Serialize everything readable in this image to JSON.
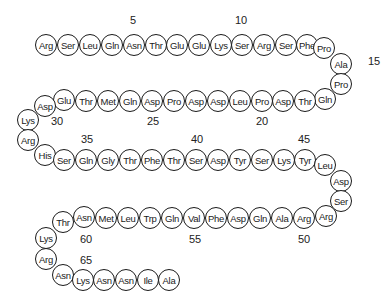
{
  "diagram": {
    "type": "peptide-sequence",
    "residues": [
      {
        "n": 1,
        "aa": "Arg",
        "x": 46,
        "y": 45
      },
      {
        "n": 2,
        "aa": "Ser",
        "x": 68,
        "y": 45
      },
      {
        "n": 3,
        "aa": "Leu",
        "x": 90,
        "y": 45
      },
      {
        "n": 4,
        "aa": "Gln",
        "x": 112,
        "y": 45
      },
      {
        "n": 5,
        "aa": "Asn",
        "x": 134,
        "y": 45
      },
      {
        "n": 6,
        "aa": "Thr",
        "x": 156,
        "y": 45
      },
      {
        "n": 7,
        "aa": "Glu",
        "x": 177,
        "y": 45
      },
      {
        "n": 8,
        "aa": "Glu",
        "x": 199,
        "y": 45
      },
      {
        "n": 9,
        "aa": "Lys",
        "x": 221,
        "y": 45
      },
      {
        "n": 10,
        "aa": "Ser",
        "x": 242,
        "y": 45
      },
      {
        "n": 11,
        "aa": "Arg",
        "x": 264,
        "y": 45
      },
      {
        "n": 12,
        "aa": "Ser",
        "x": 286,
        "y": 45
      },
      {
        "n": 13,
        "aa": "Phe",
        "x": 307,
        "y": 45
      },
      {
        "n": 14,
        "aa": "Pro",
        "x": 324,
        "y": 48
      },
      {
        "n": 15,
        "aa": "Ala",
        "x": 341,
        "y": 64
      },
      {
        "n": 16,
        "aa": "Pro",
        "x": 341,
        "y": 84
      },
      {
        "n": 17,
        "aa": "Gln",
        "x": 325,
        "y": 99
      },
      {
        "n": 18,
        "aa": "Thr",
        "x": 305,
        "y": 101
      },
      {
        "n": 19,
        "aa": "Asp",
        "x": 283,
        "y": 101
      },
      {
        "n": 20,
        "aa": "Pro",
        "x": 262,
        "y": 101
      },
      {
        "n": 21,
        "aa": "Leu",
        "x": 240,
        "y": 101
      },
      {
        "n": 22,
        "aa": "Asp",
        "x": 218,
        "y": 101
      },
      {
        "n": 23,
        "aa": "Asp",
        "x": 196,
        "y": 101
      },
      {
        "n": 24,
        "aa": "Pro",
        "x": 174,
        "y": 101
      },
      {
        "n": 25,
        "aa": "Asp",
        "x": 152,
        "y": 101
      },
      {
        "n": 26,
        "aa": "Gln",
        "x": 130,
        "y": 101
      },
      {
        "n": 27,
        "aa": "Met",
        "x": 108,
        "y": 101
      },
      {
        "n": 28,
        "aa": "Thr",
        "x": 86,
        "y": 101
      },
      {
        "n": 29,
        "aa": "Glu",
        "x": 64,
        "y": 100
      },
      {
        "n": 30,
        "aa": "Asp",
        "x": 45,
        "y": 106
      },
      {
        "n": 31,
        "aa": "Lys",
        "x": 28,
        "y": 120
      },
      {
        "n": 32,
        "aa": "Arg",
        "x": 28,
        "y": 140
      },
      {
        "n": 33,
        "aa": "His",
        "x": 45,
        "y": 155
      },
      {
        "n": 34,
        "aa": "Ser",
        "x": 64,
        "y": 160
      },
      {
        "n": 35,
        "aa": "Gln",
        "x": 86,
        "y": 160
      },
      {
        "n": 36,
        "aa": "Gly",
        "x": 108,
        "y": 160
      },
      {
        "n": 37,
        "aa": "Thr",
        "x": 130,
        "y": 160
      },
      {
        "n": 38,
        "aa": "Phe",
        "x": 152,
        "y": 160
      },
      {
        "n": 39,
        "aa": "Thr",
        "x": 174,
        "y": 160
      },
      {
        "n": 40,
        "aa": "Ser",
        "x": 196,
        "y": 160
      },
      {
        "n": 41,
        "aa": "Asp",
        "x": 218,
        "y": 160
      },
      {
        "n": 42,
        "aa": "Tyr",
        "x": 240,
        "y": 160
      },
      {
        "n": 43,
        "aa": "Ser",
        "x": 262,
        "y": 160
      },
      {
        "n": 44,
        "aa": "Lys",
        "x": 284,
        "y": 160
      },
      {
        "n": 45,
        "aa": "Tyr",
        "x": 305,
        "y": 160
      },
      {
        "n": 46,
        "aa": "Leu",
        "x": 325,
        "y": 165
      },
      {
        "n": 47,
        "aa": "Asp",
        "x": 341,
        "y": 181
      },
      {
        "n": 48,
        "aa": "Ser",
        "x": 341,
        "y": 201
      },
      {
        "n": 49,
        "aa": "Arg",
        "x": 326,
        "y": 216
      },
      {
        "n": 50,
        "aa": "Arg",
        "x": 304,
        "y": 218
      },
      {
        "n": 51,
        "aa": "Ala",
        "x": 282,
        "y": 218
      },
      {
        "n": 52,
        "aa": "Gln",
        "x": 260,
        "y": 218
      },
      {
        "n": 53,
        "aa": "Asp",
        "x": 238,
        "y": 218
      },
      {
        "n": 54,
        "aa": "Phe",
        "x": 216,
        "y": 218
      },
      {
        "n": 55,
        "aa": "Val",
        "x": 194,
        "y": 218
      },
      {
        "n": 56,
        "aa": "Gln",
        "x": 172,
        "y": 218
      },
      {
        "n": 57,
        "aa": "Trp",
        "x": 150,
        "y": 218
      },
      {
        "n": 58,
        "aa": "Leu",
        "x": 128,
        "y": 218
      },
      {
        "n": 59,
        "aa": "Met",
        "x": 106,
        "y": 218
      },
      {
        "n": 60,
        "aa": "Asn",
        "x": 84,
        "y": 217
      },
      {
        "n": 61,
        "aa": "Thr",
        "x": 63,
        "y": 222
      },
      {
        "n": 62,
        "aa": "Lys",
        "x": 46,
        "y": 238
      },
      {
        "n": 63,
        "aa": "Arg",
        "x": 46,
        "y": 259
      },
      {
        "n": 64,
        "aa": "Asn",
        "x": 63,
        "y": 275
      },
      {
        "n": 65,
        "aa": "Lys",
        "x": 83,
        "y": 280
      },
      {
        "n": 66,
        "aa": "Asn",
        "x": 104,
        "y": 280
      },
      {
        "n": 67,
        "aa": "Asn",
        "x": 126,
        "y": 280
      },
      {
        "n": 68,
        "aa": "Ile",
        "x": 148,
        "y": 280
      },
      {
        "n": 69,
        "aa": "Ala",
        "x": 169,
        "y": 280
      }
    ],
    "position_labels": [
      {
        "text": "5",
        "x": 133,
        "y": 20
      },
      {
        "text": "10",
        "x": 241,
        "y": 20
      },
      {
        "text": "15",
        "x": 374,
        "y": 61
      },
      {
        "text": "20",
        "x": 262,
        "y": 121
      },
      {
        "text": "25",
        "x": 153,
        "y": 121
      },
      {
        "text": "30",
        "x": 57,
        "y": 121
      },
      {
        "text": "35",
        "x": 87,
        "y": 139
      },
      {
        "text": "40",
        "x": 197,
        "y": 139
      },
      {
        "text": "45",
        "x": 304,
        "y": 139
      },
      {
        "text": "50",
        "x": 304,
        "y": 239
      },
      {
        "text": "55",
        "x": 195,
        "y": 239
      },
      {
        "text": "60",
        "x": 86,
        "y": 239
      },
      {
        "text": "65",
        "x": 86,
        "y": 260
      }
    ]
  }
}
